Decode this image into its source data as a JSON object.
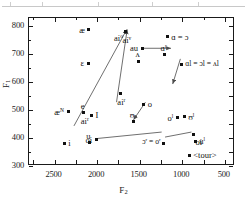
{
  "figure": {
    "type": "scatter",
    "axes": {
      "x_title": "F2",
      "y_title": "F1",
      "x_ticks": [
        "2500",
        "2000",
        "1500",
        "1000",
        "500"
      ],
      "y_ticks": [
        "300",
        "400",
        "500",
        "600",
        "700",
        "800"
      ],
      "x_range_hz": [
        2800,
        380
      ],
      "y_range_hz": [
        300,
        830
      ],
      "x_inverted": true,
      "y_inverted": true
    },
    "marker_color": "#111111",
    "line_color": "#555555"
  },
  "chart_data": {
    "type": "scatter",
    "title": "",
    "xlabel": "F2",
    "ylabel": "F1",
    "xlim": [
      2800,
      380
    ],
    "ylim": [
      830,
      300
    ],
    "grid": false,
    "legend": "none",
    "points": [
      {
        "label": "i",
        "x": 2375,
        "y": 378,
        "label_pos": "right"
      },
      {
        "label": "u",
        "x": 2080,
        "y": 380,
        "label_pos": "above"
      },
      {
        "label": "oi",
        "x": 2000,
        "y": 390,
        "label_pos": "left"
      },
      {
        "label": "<tour>",
        "x": 905,
        "y": 335,
        "label_pos": "right"
      },
      {
        "label": "uˡ",
        "x": 835,
        "y": 385,
        "label_pos": "right"
      },
      {
        "label": "oi",
        "x": 855,
        "y": 408,
        "label_pos": "belowright"
      },
      {
        "label": "ɔʳ = oʳ",
        "x": 1205,
        "y": 378,
        "label_pos": "leftline"
      },
      {
        "label": "oˡ",
        "x": 1045,
        "y": 470,
        "label_pos": "left"
      },
      {
        "label": "ʊˡ",
        "x": 965,
        "y": 472,
        "label_pos": "right"
      },
      {
        "label": "e",
        "x": 2145,
        "y": 487,
        "label_pos": "above"
      },
      {
        "label": "æᴺ",
        "x": 2330,
        "y": 490,
        "label_pos": "left"
      },
      {
        "label": "I",
        "x": 2055,
        "y": 478,
        "label_pos": "right"
      },
      {
        "label": "ʊ",
        "x": 1565,
        "y": 455,
        "label_pos": "above"
      },
      {
        "label": "o",
        "x": 1440,
        "y": 518,
        "label_pos": "right"
      },
      {
        "label": "aiʳ",
        "x": 2145,
        "y": 487,
        "label_pos": "below"
      },
      {
        "label": "aiʳ",
        "x": 1715,
        "y": 555,
        "label_pos": "below"
      },
      {
        "label": "ɛ",
        "x": 2095,
        "y": 665,
        "label_pos": "left"
      },
      {
        "label": "ʌ",
        "x": 1500,
        "y": 672,
        "label_pos": "above"
      },
      {
        "label": "ɑʳ",
        "x": 1195,
        "y": 695,
        "label_pos": "above"
      },
      {
        "label": "au",
        "x": 1460,
        "y": 718,
        "label_pos": "left"
      },
      {
        "label": "æ",
        "x": 2085,
        "y": 785,
        "label_pos": "left"
      },
      {
        "label": "aiᵒ",
        "x": 1650,
        "y": 778,
        "label_pos": "belowleft"
      },
      {
        "label": "aiᵛ",
        "x": 1650,
        "y": 778,
        "label_pos": "below"
      },
      {
        "label": "ɑ = ɔ",
        "x": 1165,
        "y": 760,
        "label_pos": "right"
      },
      {
        "label": "ɑl = ɔl = ʌl",
        "x": 1000,
        "y": 660,
        "label_pos": "right"
      }
    ],
    "connectors": [
      {
        "from": [
          1985,
          395
        ],
        "to": [
          1230,
          418
        ],
        "arrow": false,
        "note": "oi to ɔʳ=oʳ"
      },
      {
        "from": [
          1190,
          400
        ],
        "to": [
          880,
          418
        ],
        "arrow": false,
        "note": "ɔʳ=oʳ to oi"
      },
      {
        "from": [
          2260,
          440
        ],
        "to": [
          1640,
          785
        ],
        "arrow": true,
        "note": "e/aiʳ long diagonal down"
      },
      {
        "from": [
          1760,
          525
        ],
        "to": [
          1635,
          785
        ],
        "arrow": true,
        "note": "aiʳ diagonal down"
      },
      {
        "from": [
          1420,
          525
        ],
        "to": [
          1560,
          462
        ],
        "arrow": true,
        "note": "o up to ʊ"
      },
      {
        "from": [
          1440,
          718
        ],
        "to": [
          1120,
          718
        ],
        "arrow": true,
        "note": "au rightward"
      },
      {
        "from": [
          1010,
          680
        ],
        "to": [
          1100,
          590
        ],
        "arrow": true,
        "note": "ɑl=ɔl=ʌl up-right"
      }
    ]
  }
}
